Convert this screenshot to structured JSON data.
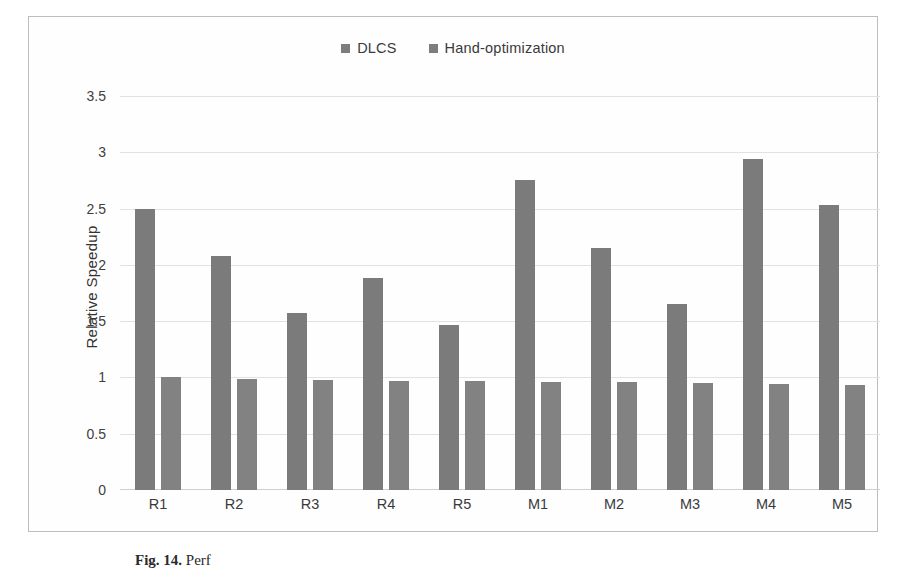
{
  "figure": {
    "caption_label": "Fig. 14.",
    "caption_text": "Perf",
    "yaxis_title": "Relative Speedup"
  },
  "legend": {
    "position": "top-center",
    "items": [
      {
        "label": "DLCS",
        "color": "#7b7b7b"
      },
      {
        "label": "Hand-optimization",
        "color": "#828282"
      }
    ]
  },
  "chart_data": {
    "type": "bar",
    "title": "",
    "xlabel": "",
    "ylabel": "Relative Speedup",
    "ylim": [
      0,
      3.5
    ],
    "yticks": [
      0,
      0.5,
      1,
      1.5,
      2,
      2.5,
      3,
      3.5
    ],
    "ytick_labels": [
      "0",
      "0.5",
      "1",
      "1.5",
      "2",
      "2.5",
      "3",
      "3.5"
    ],
    "grid": true,
    "grid_axis": "y",
    "categories": [
      "R1",
      "R2",
      "R3",
      "R4",
      "R5",
      "M1",
      "M2",
      "M3",
      "M4",
      "M5"
    ],
    "series": [
      {
        "name": "DLCS",
        "color": "#7b7b7b",
        "values": [
          2.5,
          2.08,
          1.57,
          1.88,
          1.47,
          2.75,
          2.15,
          1.65,
          2.94,
          2.53
        ]
      },
      {
        "name": "Hand-optimization",
        "color": "#828282",
        "values": [
          1.0,
          0.99,
          0.98,
          0.97,
          0.97,
          0.96,
          0.96,
          0.95,
          0.94,
          0.93
        ]
      }
    ]
  }
}
